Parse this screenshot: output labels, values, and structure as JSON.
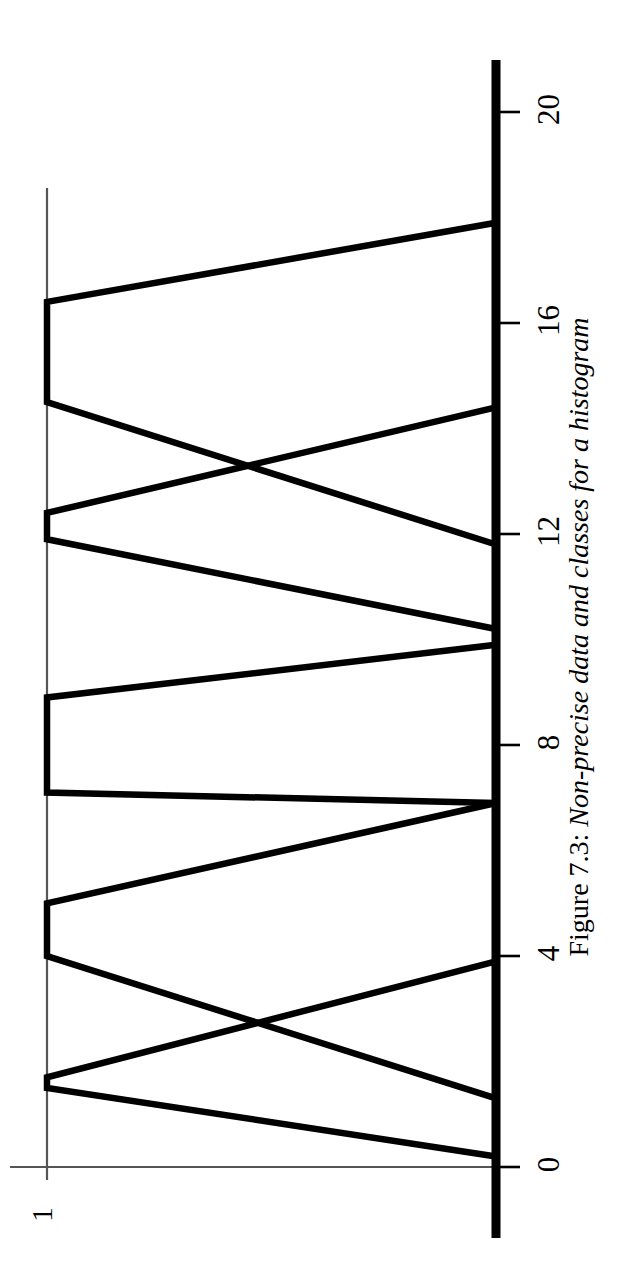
{
  "figure": {
    "caption_prefix": "Figure 7.3:",
    "caption_text": "Non-precise data and classes for a histogram",
    "caption_full": "Figure 7.3: Non-precise data and classes for a histogram",
    "orientation": "rotated-90-ccw",
    "background_color": "#ffffff",
    "line_color": "#000000",
    "frame_color": "#555555"
  },
  "axis": {
    "value_axis_label": "",
    "frequency_axis_label": "1",
    "tick_labels": [
      "0",
      "4",
      "8",
      "12",
      "16",
      "20"
    ],
    "tick_values": [
      0,
      4,
      8,
      12,
      16,
      20
    ],
    "value_min": 0,
    "value_max": 20,
    "frequency_min": 0,
    "frequency_max": 1
  },
  "chart_data": {
    "type": "line",
    "title": "Non-precise data and classes for a histogram",
    "subtitle": "",
    "xlabel": "",
    "ylabel": "1",
    "xlim": [
      0,
      20
    ],
    "ylim": [
      0,
      1
    ],
    "grid": false,
    "legend": "none",
    "xticks": [
      0,
      4,
      8,
      12,
      16,
      20
    ],
    "xticklabels": [
      "0",
      "4",
      "8",
      "12",
      "16",
      "20"
    ],
    "yticks": [
      1
    ],
    "yticklabels": [
      "1"
    ],
    "annotations": [],
    "series": [
      {
        "name": "class-1",
        "kind": "trapezoid",
        "x": [
          0.2,
          1.5,
          1.7,
          3.9
        ],
        "y": [
          0,
          1,
          1,
          0
        ]
      },
      {
        "name": "class-2",
        "kind": "trapezoid",
        "x": [
          1.3,
          4.0,
          5.0,
          6.9
        ],
        "y": [
          0,
          1,
          1,
          0
        ]
      },
      {
        "name": "class-3",
        "kind": "trapezoid",
        "x": [
          6.9,
          7.1,
          8.9,
          9.9
        ],
        "y": [
          0,
          1,
          1,
          0
        ]
      },
      {
        "name": "class-4",
        "kind": "trapezoid",
        "x": [
          10.2,
          11.9,
          12.4,
          14.4
        ],
        "y": [
          0,
          1,
          1,
          0
        ]
      },
      {
        "name": "class-5",
        "kind": "trapezoid",
        "x": [
          11.8,
          14.5,
          16.4,
          17.9
        ],
        "y": [
          0,
          1,
          1,
          0
        ]
      }
    ]
  }
}
